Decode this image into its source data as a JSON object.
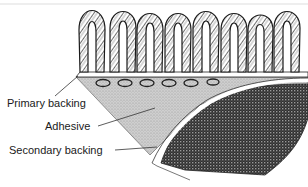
{
  "diagram": {
    "components": [
      "Pile yarn loops",
      "Primary backing",
      "Adhesive",
      "Secondary backing"
    ],
    "labels": [
      {
        "id": "primary",
        "text": "Primary backing"
      },
      {
        "id": "adhesive",
        "text": "Adhesive"
      },
      {
        "id": "secondary",
        "text": "Secondary backing"
      }
    ],
    "loop_count": 8,
    "colors": {
      "ink": "#1a1a1a",
      "adhesive_fill": "#c8c8c8",
      "secondary_fill": "#3a3a3a",
      "background": "#ffffff"
    }
  }
}
